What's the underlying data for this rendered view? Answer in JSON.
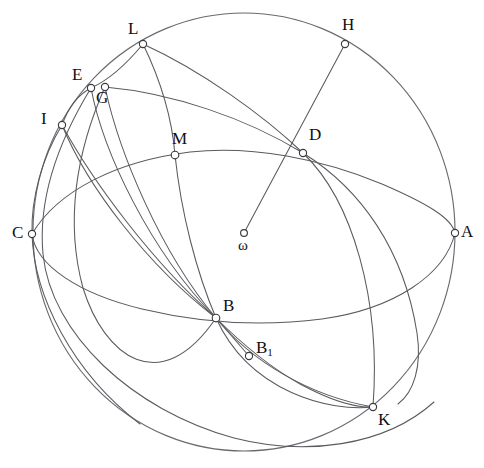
{
  "figure": {
    "background_color": "#ffffff",
    "stroke_color": "#5a5a5f",
    "label_color": "#101014",
    "width": 484,
    "height": 468,
    "sphere": {
      "name": "sphere-outline",
      "center_x": 244,
      "center_y": 232,
      "radius_x": 211,
      "radius_y": 219
    },
    "center_point": {
      "label": "ω",
      "x": 244,
      "y": 233,
      "label_x": 238,
      "label_y": 238
    },
    "points": [
      {
        "id": "A",
        "label": "A",
        "x": 455,
        "y": 233,
        "label_x": 461,
        "label_y": 223
      },
      {
        "id": "B",
        "label": "B",
        "x": 216,
        "y": 318,
        "label_x": 223,
        "label_y": 297
      },
      {
        "id": "B1",
        "label": "B",
        "sub": "1",
        "x": 249,
        "y": 356,
        "label_x": 256,
        "label_y": 339
      },
      {
        "id": "C",
        "label": "C",
        "x": 32,
        "y": 234,
        "label_x": 12,
        "label_y": 224
      },
      {
        "id": "D",
        "label": "D",
        "x": 303,
        "y": 153,
        "label_x": 309,
        "label_y": 126
      },
      {
        "id": "E",
        "label": "E",
        "x": 91,
        "y": 88,
        "label_x": 72,
        "label_y": 66
      },
      {
        "id": "G",
        "label": "G",
        "x": 105,
        "y": 87,
        "label_x": 96,
        "label_y": 89
      },
      {
        "id": "H",
        "label": "H",
        "x": 345,
        "y": 44,
        "label_x": 342,
        "label_y": 16
      },
      {
        "id": "I",
        "label": "I",
        "x": 62,
        "y": 125,
        "label_x": 41,
        "label_y": 110
      },
      {
        "id": "K",
        "label": "K",
        "x": 373,
        "y": 407,
        "label_x": 378,
        "label_y": 411
      },
      {
        "id": "L",
        "label": "L",
        "x": 143,
        "y": 44,
        "label_x": 128,
        "label_y": 20
      },
      {
        "id": "M",
        "label": "M",
        "x": 175,
        "y": 155,
        "label_x": 172,
        "label_y": 130
      }
    ],
    "curves": [
      {
        "name": "great-circle-equator-C-M-D-A",
        "d": "M 32 234 C 60 186 120 158 192 151 C 252 146 320 158 380 182 C 424 200 452 217 455 233"
      },
      {
        "name": "great-circle-equator-back-C-B-A",
        "d": "M 32 234 C 36 264 78 292 140 308 C 190 321 250 328 320 320 C 392 311 444 276 455 233"
      },
      {
        "name": "great-circle-L-M-B-K-H",
        "d": "M 143 44 C 160 80 172 118 175 155 C 180 210 196 270 216 318 C 248 392 330 412 373 407"
      },
      {
        "name": "great-circle-L-D-K-A-lower",
        "d": "M 143 44 C 200 70 262 114 303 153 C 352 200 380 300 373 407"
      },
      {
        "name": "great-circle-H-D-through-sphere",
        "d": "M 345 44 C 320 100 308 130 303 153"
      },
      {
        "name": "great-circle-G-D-right-arc",
        "d": "M 105 87 C 170 92 245 117 303 153 C 360 188 406 247 420 330"
      },
      {
        "name": "great-circle-I-C-lower-left",
        "d": "M 62 125 C 40 160 30 200 32 234 C 35 300 78 380 145 428"
      },
      {
        "name": "meridian-I-E-L-top",
        "d": "M 62 125 C 68 105 78 93 91 88 C 110 80 128 60 143 44"
      },
      {
        "name": "meridian-E-to-B-fan-1",
        "d": "M 91 88 C 104 150 150 250 216 318"
      },
      {
        "name": "meridian-G-to-B-fan-2",
        "d": "M 105 87 C 118 152 160 252 216 318"
      },
      {
        "name": "meridian-I-to-B-fan-3",
        "d": "M 62 125 C 92 180 152 262 216 318"
      },
      {
        "name": "meridian-I-to-B-fan-4",
        "d": "M 62 125 C 86 184 146 264 216 318"
      },
      {
        "name": "great-circle-E-through-C-bottom",
        "d": "M 91 88 C 60 140 40 196 44 252 C 50 330 130 408 232 437 C 300 455 380 448 432 404"
      },
      {
        "name": "great-circle-G-through-B1-K-arc",
        "d": "M 105 87 C 78 150 66 220 82 286 C 104 370 180 420 249 356 C 290 318 340 402 400 398"
      }
    ],
    "chords": [
      {
        "name": "chord-omega-to-H",
        "x1": 244,
        "y1": 233,
        "x2": 345,
        "y2": 44
      },
      {
        "name": "chord-B-to-B1",
        "x1": 216,
        "y1": 318,
        "x2": 249,
        "y2": 356
      }
    ]
  }
}
